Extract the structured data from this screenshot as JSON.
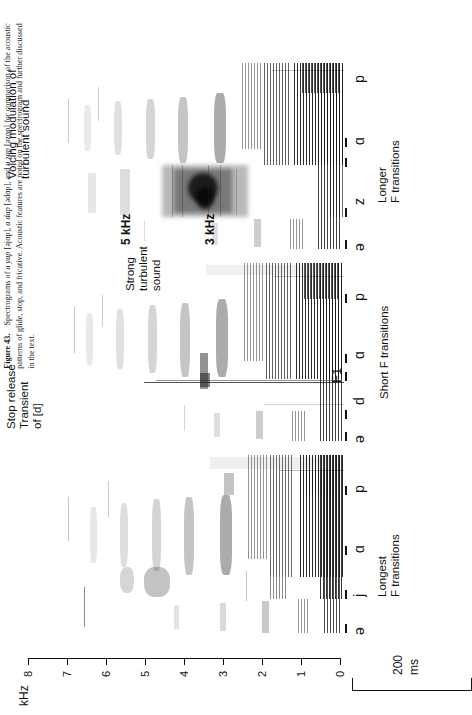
{
  "figure": {
    "number": "Figure 43.",
    "caption_part1": "Spectrograms of ",
    "utt1": "a yap",
    "utt1_ipa": " [əjɑp], ",
    "utt2": "a dap",
    "utt2_ipa": " [ədɑp], and ",
    "utt3": "a zap",
    "utt3_ipa": " [əzɑp]",
    "caption_part2": " for comparison of the acoustic patterns of glide, stop, and fricative. Acoustic features are noted on the spectrogram and further discussed in the text."
  },
  "axes": {
    "y_unit": "kHz",
    "y_ticks": [
      "8",
      "7",
      "6",
      "5",
      "4",
      "3",
      "2",
      "1",
      "0"
    ],
    "y_min": 0,
    "y_max": 8,
    "time_scale_value": "200",
    "time_scale_unit": "ms"
  },
  "annotations": {
    "voicing_modulation": "Voicing modulation of\nturbulent sound",
    "strong_turbulent": "Strong\nturbulent\nsound",
    "stop_release": "Stop release\nTransient\nof [d]",
    "khz5": "5 kHz",
    "khz3": "3 kHz",
    "longer_f": "Longer\nF transitions",
    "short_f": "Short F transitions",
    "longest_f": "Longest\nF transitions",
    "f1": "F1"
  },
  "panels": [
    {
      "id": "panel-yap",
      "word": "a yap",
      "segments": [
        "ə",
        "j",
        "ɑ",
        "p"
      ],
      "note": "Longest\nF transitions"
    },
    {
      "id": "panel-dap",
      "word": "a dap",
      "segments": [
        "ə",
        "d",
        "ɑ",
        "p"
      ],
      "note": "Short F transitions"
    },
    {
      "id": "panel-zap",
      "word": "a zap",
      "segments": [
        "ə",
        "z",
        "ɑ",
        "p"
      ],
      "note": "Longer\nF transitions"
    }
  ],
  "chart_data": {
    "type": "heatmap",
    "xlabel": "Time",
    "ylabel": "kHz",
    "ylim": [
      0,
      8
    ],
    "yticks": [
      8,
      7,
      6,
      5,
      4,
      3,
      2,
      1,
      0
    ],
    "time_scale_bar_ms": 200,
    "grid": false,
    "legend": "none",
    "panels": [
      {
        "name": "a yap [əjɑp]",
        "segment_labels": [
          "ə",
          "j",
          "ɑ",
          "p"
        ],
        "formant_transition": "longest",
        "annotation": "Longest F transitions"
      },
      {
        "name": "a dap [ədɑp]",
        "segment_labels": [
          "ə",
          "d",
          "ɑ",
          "p"
        ],
        "formant_transition": "short",
        "annotation": "Short F transitions; Stop release Transient of [d]; F1"
      },
      {
        "name": "a zap [əzɑp]",
        "segment_labels": [
          "ə",
          "z",
          "ɑ",
          "p"
        ],
        "formant_transition": "longer",
        "annotation": "Longer F transitions; Strong turbulent sound at 3-5 kHz; Voicing modulation of turbulent sound",
        "frication_band_low_khz": 3,
        "frication_band_high_khz": 5
      }
    ]
  }
}
